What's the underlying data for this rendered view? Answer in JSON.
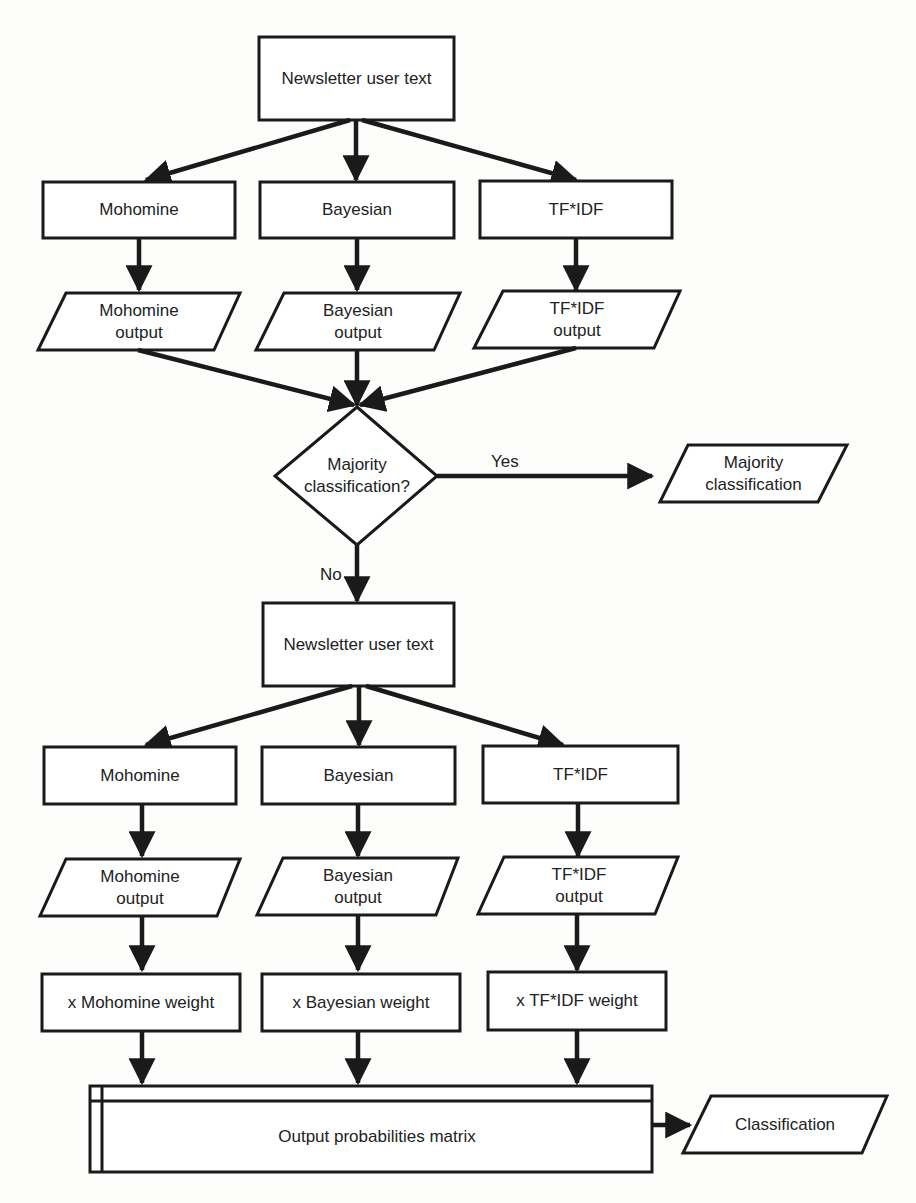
{
  "diagram": {
    "type": "flowchart",
    "stage1": {
      "input": "Newsletter user text",
      "classifiers": [
        "Mohomine",
        "Bayesian",
        "TF*IDF"
      ],
      "outputs": [
        "Mohomine\noutput",
        "Bayesian\noutput",
        "TF*IDF\noutput"
      ]
    },
    "decision": {
      "question": "Majority\nclassification?",
      "yes_label": "Yes",
      "no_label": "No",
      "yes_result": "Majority\nclassification"
    },
    "stage2": {
      "input": "Newsletter user text",
      "classifiers": [
        "Mohomine",
        "Bayesian",
        "TF*IDF"
      ],
      "outputs": [
        "Mohomine\noutput",
        "Bayesian\noutput",
        "TF*IDF\noutput"
      ],
      "weights": [
        "x Mohomine weight",
        "x Bayesian weight",
        "x TF*IDF weight"
      ]
    },
    "matrix": "Output probabilities matrix",
    "final": "Classification"
  }
}
